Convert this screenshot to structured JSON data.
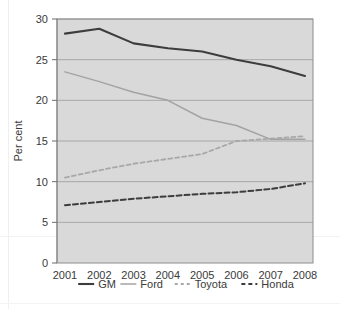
{
  "chart_data": {
    "type": "line",
    "title": "",
    "xlabel": "",
    "ylabel": "Per cent",
    "x": [
      2001,
      2002,
      2003,
      2004,
      2005,
      2006,
      2007,
      2008
    ],
    "categories": [
      "2001",
      "2002",
      "2003",
      "2004",
      "2005",
      "2006",
      "2007",
      "2008"
    ],
    "ylim": [
      0,
      30
    ],
    "yticks": [
      0,
      5,
      10,
      15,
      20,
      25,
      30
    ],
    "ytick_labels": [
      "0",
      "5",
      "10",
      "15",
      "20",
      "25",
      "30"
    ],
    "grid": true,
    "legend_position": "bottom",
    "plot_background": "#d9d9d9",
    "series": [
      {
        "name": "GM",
        "values": [
          28.2,
          28.8,
          27.0,
          26.4,
          26.0,
          25.0,
          24.2,
          23.0
        ],
        "color": "#3d3d3d",
        "style": "solid",
        "width": 2.1
      },
      {
        "name": "Ford",
        "values": [
          23.5,
          22.3,
          21.0,
          20.0,
          17.8,
          16.9,
          15.2,
          15.2
        ],
        "color": "#a3a3a3",
        "style": "solid",
        "width": 1.5
      },
      {
        "name": "Toyota",
        "values": [
          10.5,
          11.4,
          12.2,
          12.8,
          13.4,
          15.0,
          15.3,
          15.6
        ],
        "color": "#a8a8a8",
        "style": "dashed",
        "width": 1.8
      },
      {
        "name": "Honda",
        "values": [
          7.1,
          7.5,
          7.9,
          8.2,
          8.5,
          8.7,
          9.1,
          9.8
        ],
        "color": "#3d3d3d",
        "style": "dashed",
        "width": 2.0
      }
    ]
  },
  "legend": {
    "items": [
      {
        "label": "GM"
      },
      {
        "label": "Ford"
      },
      {
        "label": "Toyota"
      },
      {
        "label": "Honda"
      }
    ]
  }
}
